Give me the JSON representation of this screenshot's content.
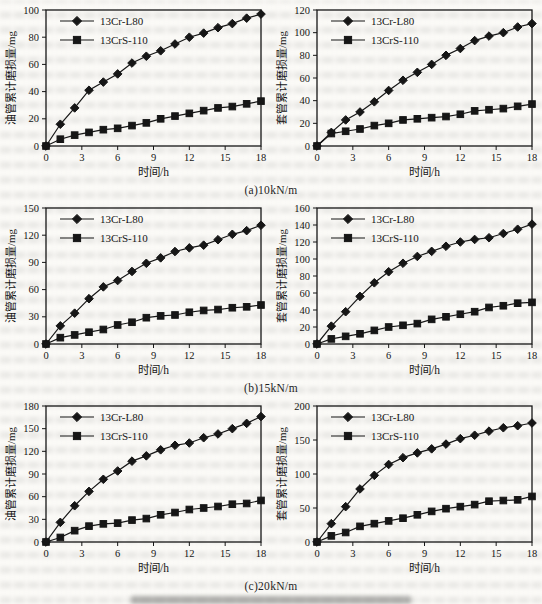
{
  "captions": [
    "(a)10kN/m",
    "(b)15kN/m",
    "(c)20kN/m"
  ],
  "legend": [
    "13Cr-L80",
    "13CrS-110"
  ],
  "ink_color": "#161616",
  "chart_data": [
    {
      "type": "line",
      "panel": "(a) left - tubing wear at 10kN/m",
      "xlabel": "时间/h",
      "ylabel": "油管累计磨损量/mg",
      "xlim": [
        0,
        18
      ],
      "ylim": [
        0,
        100
      ],
      "xticks": [
        0,
        3,
        6,
        9,
        12,
        15,
        18
      ],
      "yticks": [
        0,
        20,
        40,
        60,
        80,
        100
      ],
      "x": [
        0,
        1.2,
        2.4,
        3.6,
        4.8,
        6,
        7.2,
        8.4,
        9.6,
        10.8,
        12,
        13.2,
        14.4,
        15.6,
        16.8,
        18
      ],
      "grid": false,
      "legend_position": "top-left",
      "series": [
        {
          "name": "13Cr-L80",
          "marker": "diamond",
          "values": [
            0,
            16,
            28,
            41,
            47,
            53,
            61,
            66,
            70,
            75,
            80,
            83,
            87,
            90,
            94,
            97
          ]
        },
        {
          "name": "13CrS-110",
          "marker": "square",
          "values": [
            0,
            5,
            8,
            10,
            12,
            13,
            15,
            17,
            20,
            22,
            24,
            26,
            28,
            29,
            31,
            33
          ]
        }
      ]
    },
    {
      "type": "line",
      "panel": "(a) right - casing wear at 10kN/m",
      "xlabel": "时间/h",
      "ylabel": "套管累计磨损量/mg",
      "xlim": [
        0,
        18
      ],
      "ylim": [
        0,
        120
      ],
      "xticks": [
        0,
        3,
        6,
        9,
        12,
        15,
        18
      ],
      "yticks": [
        0,
        20,
        40,
        60,
        80,
        100,
        120
      ],
      "x": [
        0,
        1.2,
        2.4,
        3.6,
        4.8,
        6,
        7.2,
        8.4,
        9.6,
        10.8,
        12,
        13.2,
        14.4,
        15.6,
        16.8,
        18
      ],
      "grid": false,
      "legend_position": "top-left",
      "series": [
        {
          "name": "13Cr-L80",
          "marker": "diamond",
          "values": [
            0,
            12,
            23,
            30,
            39,
            49,
            58,
            65,
            72,
            80,
            86,
            93,
            97,
            100,
            105,
            108
          ]
        },
        {
          "name": "13CrS-110",
          "marker": "square",
          "values": [
            0,
            11,
            13,
            15,
            18,
            20,
            23,
            24,
            25,
            26,
            28,
            31,
            32,
            33,
            35,
            37
          ]
        }
      ]
    },
    {
      "type": "line",
      "panel": "(b) left - tubing wear at 15kN/m",
      "xlabel": "时间/h",
      "ylabel": "油管累计磨损量/mg",
      "xlim": [
        0,
        18
      ],
      "ylim": [
        0,
        150
      ],
      "xticks": [
        0,
        3,
        6,
        9,
        12,
        15,
        18
      ],
      "yticks": [
        0,
        30,
        60,
        90,
        120,
        150
      ],
      "x": [
        0,
        1.2,
        2.4,
        3.6,
        4.8,
        6,
        7.2,
        8.4,
        9.6,
        10.8,
        12,
        13.2,
        14.4,
        15.6,
        16.8,
        18
      ],
      "grid": false,
      "legend_position": "top-left",
      "series": [
        {
          "name": "13Cr-L80",
          "marker": "diamond",
          "values": [
            0,
            20,
            34,
            50,
            63,
            70,
            80,
            89,
            95,
            102,
            106,
            109,
            115,
            121,
            125,
            131
          ]
        },
        {
          "name": "13CrS-110",
          "marker": "square",
          "values": [
            0,
            7,
            10,
            13,
            16,
            21,
            24,
            29,
            31,
            32,
            35,
            37,
            38,
            40,
            41,
            43
          ]
        }
      ]
    },
    {
      "type": "line",
      "panel": "(b) right - casing wear at 15kN/m",
      "xlabel": "时间/h",
      "ylabel": "套管累计磨损量/mg",
      "xlim": [
        0,
        18
      ],
      "ylim": [
        0,
        160
      ],
      "xticks": [
        0,
        3,
        6,
        9,
        12,
        15,
        18
      ],
      "yticks": [
        0,
        20,
        40,
        60,
        80,
        100,
        120,
        140,
        160
      ],
      "x": [
        0,
        1.2,
        2.4,
        3.6,
        4.8,
        6,
        7.2,
        8.4,
        9.6,
        10.8,
        12,
        13.2,
        14.4,
        15.6,
        16.8,
        18
      ],
      "grid": false,
      "legend_position": "top-left",
      "series": [
        {
          "name": "13Cr-L80",
          "marker": "diamond",
          "values": [
            0,
            21,
            38,
            56,
            72,
            85,
            95,
            103,
            109,
            115,
            120,
            123,
            125,
            130,
            135,
            141
          ]
        },
        {
          "name": "13CrS-110",
          "marker": "square",
          "values": [
            0,
            6,
            9,
            12,
            16,
            20,
            22,
            24,
            29,
            32,
            35,
            38,
            43,
            45,
            48,
            49
          ]
        }
      ]
    },
    {
      "type": "line",
      "panel": "(c) left - tubing wear at 20kN/m",
      "xlabel": "时间/h",
      "ylabel": "油管累计磨损量/mg",
      "xlim": [
        0,
        18
      ],
      "ylim": [
        0,
        180
      ],
      "xticks": [
        0,
        3,
        6,
        9,
        12,
        15,
        18
      ],
      "yticks": [
        0,
        30,
        60,
        90,
        120,
        150,
        180
      ],
      "x": [
        0,
        1.2,
        2.4,
        3.6,
        4.8,
        6,
        7.2,
        8.4,
        9.6,
        10.8,
        12,
        13.2,
        14.4,
        15.6,
        16.8,
        18
      ],
      "grid": false,
      "legend_position": "top-left",
      "series": [
        {
          "name": "13Cr-L80",
          "marker": "diamond",
          "values": [
            0,
            26,
            48,
            67,
            83,
            94,
            107,
            114,
            122,
            128,
            131,
            138,
            143,
            150,
            157,
            166
          ]
        },
        {
          "name": "13CrS-110",
          "marker": "square",
          "values": [
            0,
            6,
            15,
            21,
            24,
            25,
            29,
            31,
            36,
            39,
            43,
            45,
            47,
            50,
            51,
            55
          ]
        }
      ]
    },
    {
      "type": "line",
      "panel": "(c) right - casing wear at 20kN/m",
      "xlabel": "时间/h",
      "ylabel": "套管累计磨损量/mg",
      "xlim": [
        0,
        18
      ],
      "ylim": [
        0,
        200
      ],
      "xticks": [
        0,
        3,
        6,
        9,
        12,
        15,
        18
      ],
      "yticks": [
        0,
        50,
        100,
        150,
        200
      ],
      "x": [
        0,
        1.2,
        2.4,
        3.6,
        4.8,
        6,
        7.2,
        8.4,
        9.6,
        10.8,
        12,
        13.2,
        14.4,
        15.6,
        16.8,
        18
      ],
      "grid": false,
      "legend_position": "top-left",
      "series": [
        {
          "name": "13Cr-L80",
          "marker": "diamond",
          "values": [
            0,
            27,
            52,
            78,
            98,
            114,
            124,
            131,
            137,
            144,
            152,
            157,
            163,
            168,
            171,
            175
          ]
        },
        {
          "name": "13CrS-110",
          "marker": "square",
          "values": [
            0,
            9,
            14,
            23,
            27,
            31,
            35,
            40,
            45,
            49,
            52,
            55,
            60,
            61,
            62,
            67
          ]
        }
      ]
    }
  ]
}
